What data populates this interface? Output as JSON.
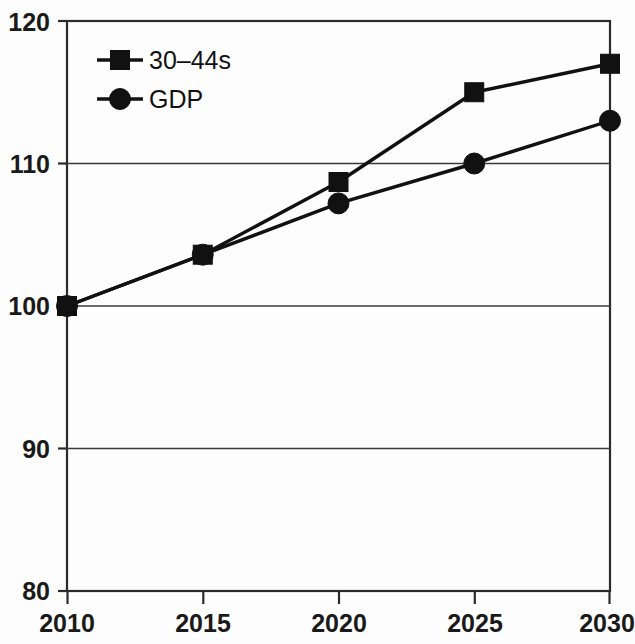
{
  "chart_data": {
    "type": "line",
    "title": "",
    "xlabel": "",
    "ylabel": "",
    "x": [
      2010,
      2015,
      2020,
      2025,
      2030
    ],
    "xtick_labels": [
      "2010",
      "2015",
      "2020",
      "2025",
      "2030"
    ],
    "ytick_labels": [
      "80",
      "90",
      "100",
      "110",
      "120"
    ],
    "yticks": [
      80,
      90,
      100,
      110,
      120
    ],
    "ylim": [
      80,
      120
    ],
    "xlim": [
      2010,
      2030
    ],
    "grid": "horizontal",
    "legend_position": "top-left-inside",
    "series": [
      {
        "name": "30–44s",
        "marker": "square",
        "color": "#111111",
        "values": [
          100,
          103.6,
          108.7,
          115,
          117
        ]
      },
      {
        "name": "GDP",
        "marker": "circle",
        "color": "#111111",
        "values": [
          100,
          103.6,
          107.2,
          110,
          113
        ]
      }
    ]
  },
  "legend": {
    "items": [
      {
        "label": "30–44s",
        "marker": "square"
      },
      {
        "label": "GDP",
        "marker": "circle"
      }
    ]
  },
  "axes": {
    "y_labels": [
      "120",
      "110",
      "100",
      "90",
      "80"
    ],
    "x_labels": [
      "2010",
      "2015",
      "2020",
      "2025",
      "2030"
    ]
  },
  "colors": {
    "line": "#111111",
    "frame": "#2b2b2b",
    "grid": "#3a3a3a",
    "background": "#fdfdfd",
    "text": "#1a1a1a"
  }
}
